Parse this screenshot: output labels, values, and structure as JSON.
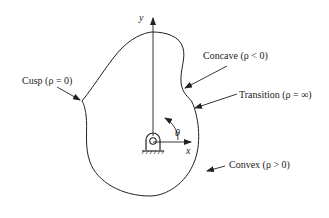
{
  "diagram": {
    "type": "cam-profile-curvature",
    "axes": {
      "x_label": "x",
      "y_label": "y",
      "angle_label": "θ"
    },
    "annotations": [
      {
        "id": "cusp",
        "label": "Cusp (ρ = 0)"
      },
      {
        "id": "concave",
        "label": "Concave (ρ < 0)"
      },
      {
        "id": "transition",
        "label": "Transition (ρ = ∞)"
      },
      {
        "id": "convex",
        "label": "Convex (ρ > 0)"
      }
    ],
    "colors": {
      "line": "#222222",
      "background": "#ffffff"
    }
  }
}
